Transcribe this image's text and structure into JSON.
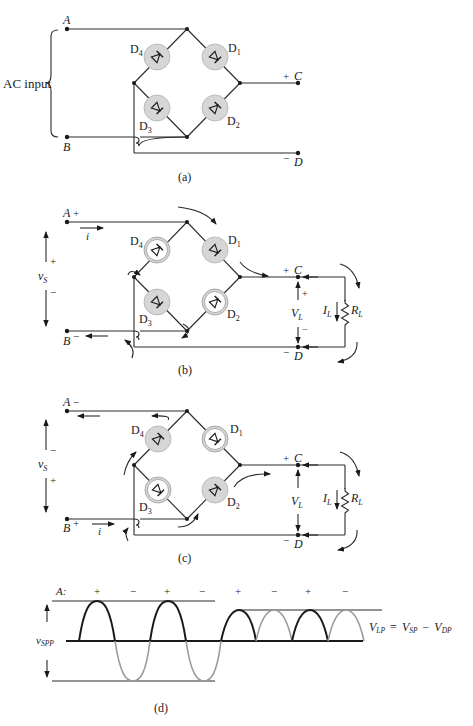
{
  "figure": {
    "colors": {
      "ink": "#1a1a1a",
      "diode_fill": "#d6d6d6",
      "diode_ring": "#9a9a9a",
      "gray_wave": "#9a9a9a",
      "background": "#ffffff"
    },
    "panel_a": {
      "caption": "(a)",
      "input_label": "AC input",
      "terminals": {
        "A": "A",
        "B": "B",
        "C": "C",
        "D": "D"
      },
      "polarity": {
        "C": "+",
        "D": "−"
      },
      "diodes": [
        "D4",
        "D1",
        "D3",
        "D2"
      ],
      "diode_states": {
        "D1": "filled",
        "D2": "filled",
        "D3": "filled",
        "D4": "filled"
      }
    },
    "panel_b": {
      "caption": "(b)",
      "source_label": "v",
      "source_sub": "S",
      "source_polarity": {
        "top": "+",
        "bottom": "−"
      },
      "terminal_polarity": {
        "A": "+",
        "B": "−",
        "C": "+",
        "D": "−"
      },
      "current_label": "i",
      "load": {
        "voltage_label": "V",
        "voltage_sub": "L",
        "voltage_polarity_top": "+",
        "voltage_polarity_bottom": "−",
        "current_label": "I",
        "current_sub": "L",
        "resistor_label": "R",
        "resistor_sub": "L"
      },
      "conducting": [
        "D1",
        "D3"
      ],
      "off": [
        "D4",
        "D2"
      ]
    },
    "panel_c": {
      "caption": "(c)",
      "source_label": "v",
      "source_sub": "S",
      "source_polarity": {
        "top": "−",
        "bottom": "+"
      },
      "terminal_polarity": {
        "A": "−",
        "B": "+",
        "C": "+",
        "D": "−"
      },
      "current_label": "i",
      "load": {
        "voltage_label": "V",
        "voltage_sub": "L",
        "current_label": "I",
        "current_sub": "L",
        "resistor_label": "R",
        "resistor_sub": "L"
      },
      "conducting": [
        "D4",
        "D2"
      ],
      "off": [
        "D1",
        "D3"
      ]
    },
    "panel_d": {
      "caption": "(d)",
      "row_label": "A:",
      "half_cycle_signs": [
        "+",
        "−",
        "+",
        "−",
        "+",
        "−",
        "+",
        "−"
      ],
      "vspp_label": "v",
      "vspp_sub": "SPP",
      "equation": {
        "lhs": "V",
        "lhs_sub": "LP",
        "eq": "=",
        "t1": "V",
        "t1_sub": "SP",
        "minus": "−",
        "t2": "V",
        "t2_sub": "DP"
      }
    }
  }
}
